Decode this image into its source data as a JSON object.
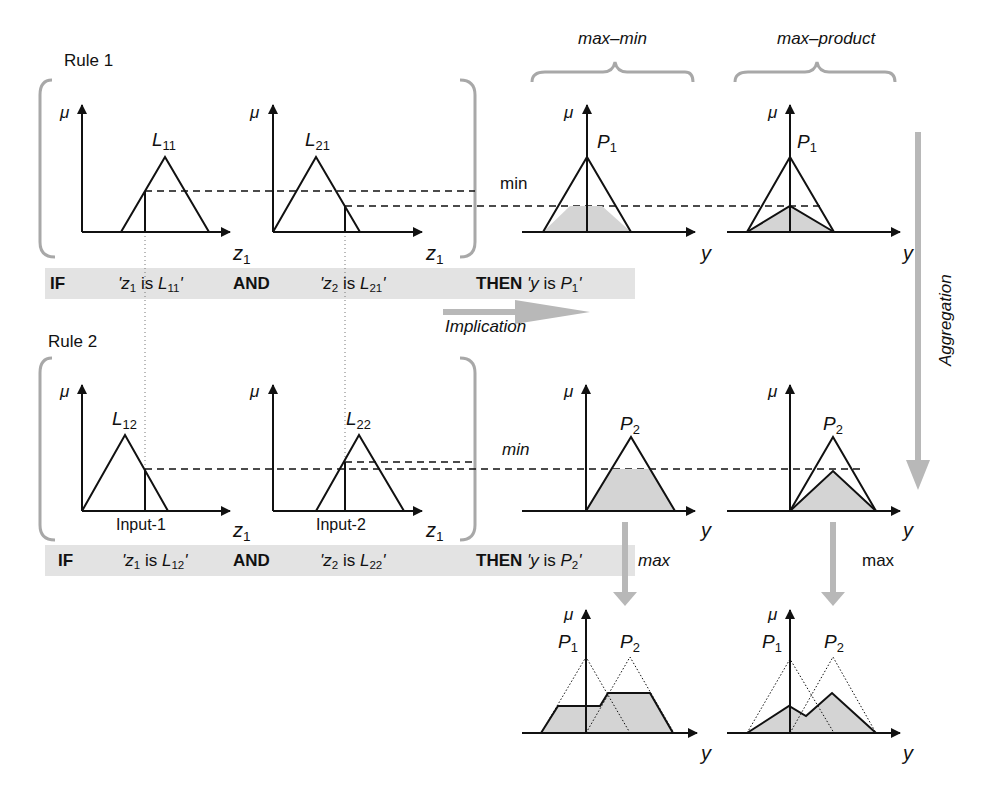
{
  "labels": {
    "rule1": "Rule 1",
    "rule2": "Rule 2",
    "max_min": "max–min",
    "max_product": "max–product",
    "min_rule1": "min",
    "min_rule2": "min",
    "max_left": "max",
    "max_right": "max",
    "implication": "Implication",
    "aggregation": "Aggregation",
    "input1": "Input-1",
    "input2": "Input-2",
    "mu": "μ",
    "z": "z",
    "z_sub": "1",
    "y": "y"
  },
  "sets": {
    "L11": {
      "base": "L",
      "sub": "11"
    },
    "L21": {
      "base": "L",
      "sub": "21"
    },
    "L12": {
      "base": "L",
      "sub": "12"
    },
    "L22": {
      "base": "L",
      "sub": "22"
    },
    "P1": {
      "base": "P",
      "sub": "1"
    },
    "P2": {
      "base": "P",
      "sub": "2"
    }
  },
  "rule1_text": {
    "if": "IF",
    "c1_open": "'z",
    "c1_sub": "1",
    "c1_is": " is ",
    "c1_set": "L",
    "c1_set_sub": "11",
    "c1_close": "'",
    "and": "AND",
    "c2_open": "'z",
    "c2_sub": "2",
    "c2_is": " is ",
    "c2_set": "L",
    "c2_set_sub": "21",
    "c2_close": "'",
    "then": "THEN",
    "con_open": "'y",
    "con_is": " is ",
    "con_set": "P",
    "con_set_sub": "1",
    "con_close": "'"
  },
  "rule2_text": {
    "if": "IF",
    "c1_open": "'z",
    "c1_sub": "1",
    "c1_is": " is ",
    "c1_set": "L",
    "c1_set_sub": "12",
    "c1_close": "'",
    "and": "AND",
    "c2_open": "'z",
    "c2_sub": "2",
    "c2_is": " is ",
    "c2_set": "L",
    "c2_set_sub": "22",
    "c2_close": "'",
    "then": "THEN",
    "con_open": "'y",
    "con_is": " is ",
    "con_set": "P",
    "con_set_sub": "2",
    "con_close": "'"
  },
  "colors": {
    "band": "#e3e3e3",
    "arrow_gray": "#b8b8b8",
    "fill_gray": "#d4d4d4",
    "bracket_gray": "#a8a8a8",
    "ink": "#111111"
  }
}
